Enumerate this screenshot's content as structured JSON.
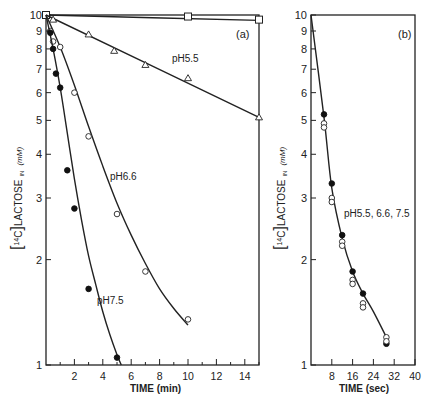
{
  "chart_data": [
    {
      "panel": "(a)",
      "type": "line",
      "xlabel": "TIME (min)",
      "ylabel": "[14C]LACTOSE IN (mM)",
      "yscale": "log",
      "xlim": [
        0,
        15
      ],
      "ylim": [
        1,
        10
      ],
      "xticks": [
        2,
        4,
        6,
        8,
        10,
        12,
        14
      ],
      "xminor": [
        1,
        3,
        5,
        7,
        9,
        11,
        13,
        15
      ],
      "yticks": [
        1,
        2,
        3,
        4,
        5,
        6,
        7,
        8,
        9,
        10
      ],
      "ytick_labels": [
        "1",
        "2",
        "3",
        "4",
        "5",
        "6",
        "7",
        "8",
        "9",
        "10"
      ],
      "series": [
        {
          "name": "control",
          "marker": "square-open",
          "x": [
            0,
            10,
            15
          ],
          "y": [
            10,
            9.9,
            9.7
          ],
          "curve": [
            [
              0,
              10
            ],
            [
              15,
              9.65
            ]
          ]
        },
        {
          "name": "pH5.5",
          "marker": "triangle-open",
          "x": [
            0.5,
            3,
            4.8,
            7,
            10,
            15
          ],
          "y": [
            9.7,
            8.8,
            7.9,
            7.2,
            6.6,
            5.1
          ],
          "curve": [
            [
              0,
              10
            ],
            [
              15,
              5.1
            ]
          ]
        },
        {
          "name": "pH6.6",
          "marker": "circle-open",
          "x": [
            0.3,
            0.5,
            1,
            2,
            3,
            5,
            7,
            10
          ],
          "y": [
            9.0,
            8.4,
            8.1,
            6.0,
            4.5,
            2.7,
            1.85,
            1.35
          ],
          "curve": [
            [
              0,
              10
            ],
            [
              1,
              8.1
            ],
            [
              2,
              6.3
            ],
            [
              3,
              4.8
            ],
            [
              4,
              3.7
            ],
            [
              5,
              2.9
            ],
            [
              6,
              2.35
            ],
            [
              7,
              1.95
            ],
            [
              8,
              1.65
            ],
            [
              9,
              1.45
            ],
            [
              10,
              1.3
            ]
          ]
        },
        {
          "name": "pH7.5",
          "marker": "circle-filled",
          "x": [
            0.3,
            0.5,
            0.7,
            1,
            1.5,
            2,
            3,
            5
          ],
          "y": [
            8.9,
            8.0,
            6.8,
            6.2,
            3.6,
            2.8,
            1.65,
            1.05
          ],
          "curve": [
            [
              0,
              10
            ],
            [
              0.5,
              8.0
            ],
            [
              1,
              6.2
            ],
            [
              1.5,
              4.6
            ],
            [
              2,
              3.4
            ],
            [
              2.5,
              2.6
            ],
            [
              3,
              2.05
            ],
            [
              3.5,
              1.7
            ],
            [
              4,
              1.42
            ],
            [
              4.5,
              1.22
            ],
            [
              5,
              1.07
            ],
            [
              5.3,
              1.0
            ]
          ]
        }
      ],
      "annotations": [
        "(a)",
        "pH5.5",
        "pH6.6",
        "pH7.5"
      ]
    },
    {
      "panel": "(b)",
      "type": "line",
      "xlabel": "TIME (sec)",
      "ylabel": "[14C]LACTOSE IN (mM)",
      "yscale": "log",
      "xlim": [
        0,
        40
      ],
      "ylim": [
        1,
        10
      ],
      "xticks": [
        8,
        16,
        24,
        32,
        40
      ],
      "yticks": [
        1,
        2,
        3,
        4,
        5,
        6,
        7,
        8,
        9,
        10
      ],
      "ytick_labels": [
        "1",
        "2",
        "3",
        "4",
        "5",
        "6",
        "7",
        "8",
        "9",
        "10"
      ],
      "series": [
        {
          "name": "pH5.5, 6.6, 7.5",
          "marker": "mixed-open-filled",
          "x": [
            5,
            8,
            12,
            16,
            20,
            29
          ],
          "y_filled": [
            5.2,
            3.3,
            2.35,
            1.85,
            1.6,
            1.15
          ],
          "y_open": [
            4.9,
            3.0,
            2.25,
            1.75,
            1.5,
            1.2
          ],
          "curve": [
            [
              0,
              10
            ],
            [
              5,
              5.1
            ],
            [
              8,
              3.2
            ],
            [
              12,
              2.3
            ],
            [
              16,
              1.85
            ],
            [
              20,
              1.6
            ],
            [
              24,
              1.42
            ],
            [
              29,
              1.2
            ]
          ]
        }
      ],
      "annotations": [
        "(b)",
        "pH5.5, 6.6, 7.5"
      ]
    }
  ],
  "panels": {
    "a": {
      "tag": "(a)",
      "xlabel": "TIME (min)",
      "ylabel_main": "LACTOSE",
      "ylabel_sup": "14",
      "ylabel_c": "C",
      "ylabel_sub": "IN",
      "ylabel_unit": "(mM)",
      "labels": {
        "ph55": "pH5.5",
        "ph66": "pH6.6",
        "ph75": "pH7.5"
      }
    },
    "b": {
      "tag": "(b)",
      "xlabel": "TIME (sec)",
      "ylabel_main": "LACTOSE",
      "ylabel_sup": "14",
      "ylabel_c": "C",
      "ylabel_sub": "IN",
      "ylabel_unit": "(mM)",
      "labels": {
        "all": "pH5.5, 6.6, 7.5"
      }
    }
  }
}
